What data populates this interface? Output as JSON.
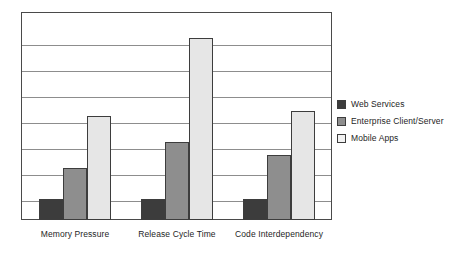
{
  "chart_data": {
    "type": "bar",
    "title": "",
    "xlabel": "",
    "ylabel": "",
    "categories": [
      "Memory Pressure",
      "Release Cycle Time",
      "Code Interdependency"
    ],
    "series": [
      {
        "name": "Web Services",
        "color": "#3c3c3c",
        "values": [
          0.8,
          0.8,
          0.8
        ]
      },
      {
        "name": "Enterprise Client/Server",
        "color": "#8e8e8e",
        "values": [
          2.0,
          3.0,
          2.5
        ]
      },
      {
        "name": "Mobile Apps",
        "color": "#e6e6e6",
        "values": [
          4.0,
          7.0,
          4.2
        ]
      }
    ],
    "ylim": [
      0,
      8
    ],
    "ytick_labels": [],
    "gridlines": 7,
    "grid": true,
    "legend_position": "right",
    "axis_frame": true
  },
  "legend": {
    "items": [
      {
        "label": "Web Services",
        "swatch": "dark-gray-swatch"
      },
      {
        "label": "Enterprise Client/Server",
        "swatch": "medium-gray-swatch"
      },
      {
        "label": "Mobile Apps",
        "swatch": "light-gray-swatch"
      }
    ]
  },
  "colors": {
    "series_dark": "#3c3c3c",
    "series_medium": "#8e8e8e",
    "series_light": "#e6e6e6",
    "gridline": "#8d8d8d",
    "frame": "#4a4a4a",
    "background": "#ffffff",
    "text": "#1e1e1e"
  }
}
